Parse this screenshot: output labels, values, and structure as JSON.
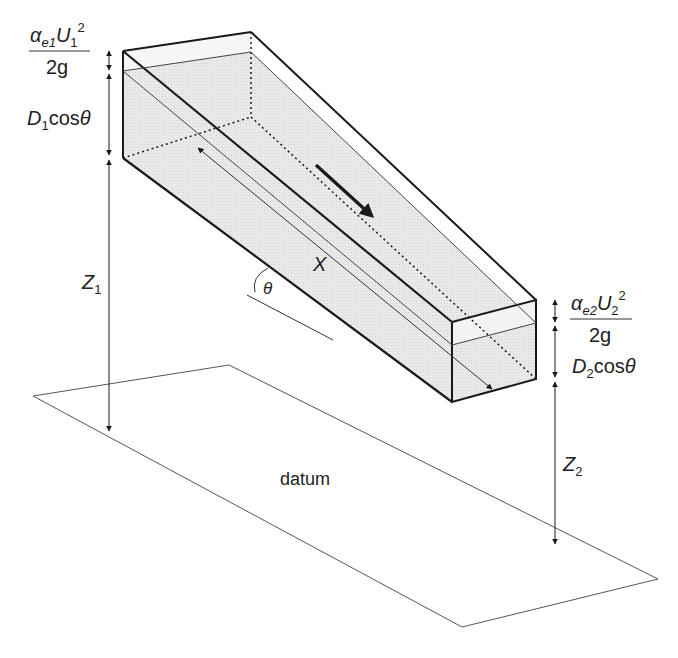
{
  "figure": {
    "type": "open-channel-energy-diagram",
    "colors": {
      "line": "#1a1a1a",
      "thin_line": "#444444",
      "water_fill": "#e4e4e4",
      "background": "#ffffff"
    }
  },
  "labels": {
    "velocity_head_1": {
      "alpha": "α",
      "alpha_sub": "e1",
      "U": "U",
      "U_sub": "1",
      "U_sup": "2",
      "denominator": "2g"
    },
    "depth_1": {
      "D": "D",
      "D_sub": "1",
      "cos": "cos",
      "theta": "θ"
    },
    "elevation_1": {
      "Z": "Z",
      "Z_sub": "1"
    },
    "velocity_head_2": {
      "alpha": "α",
      "alpha_sub": "e2",
      "U": "U",
      "U_sub": "2",
      "U_sup": "2",
      "denominator": "2g"
    },
    "depth_2": {
      "D": "D",
      "D_sub": "2",
      "cos": "cos",
      "theta": "θ"
    },
    "elevation_2": {
      "Z": "Z",
      "Z_sub": "2"
    },
    "length": "X",
    "angle": "θ",
    "datum": "datum"
  }
}
